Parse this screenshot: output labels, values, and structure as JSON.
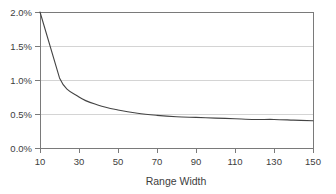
{
  "chart_data": {
    "type": "line",
    "title": "",
    "xlabel": "Range Width",
    "ylabel": "",
    "xlim": [
      10,
      150
    ],
    "ylim": [
      0.0,
      2.0
    ],
    "grid": true,
    "legend": false,
    "x_ticks": [
      10,
      30,
      50,
      70,
      90,
      110,
      130,
      150
    ],
    "x_tick_labels": [
      "10",
      "30",
      "50",
      "70",
      "90",
      "110",
      "130",
      "150"
    ],
    "y_ticks": [
      0.0,
      0.5,
      1.0,
      1.5,
      2.0
    ],
    "y_tick_labels": [
      "0.0%",
      "0.5%",
      "1.0%",
      "1.5%",
      "2.0%"
    ],
    "y_unit": "%",
    "series": [
      {
        "name": "",
        "color": "#444444",
        "x": [
          10,
          20,
          30,
          40,
          50,
          60,
          70,
          80,
          90,
          100,
          110,
          120,
          130,
          140,
          150
        ],
        "values": [
          2.0,
          1.03,
          0.75,
          0.63,
          0.56,
          0.51,
          0.48,
          0.46,
          0.45,
          0.44,
          0.43,
          0.42,
          0.42,
          0.41,
          0.4
        ]
      }
    ]
  },
  "axis_labels": {
    "y": {
      "t0": "0.0%",
      "t1": "0.5%",
      "t2": "1.0%",
      "t3": "1.5%",
      "t4": "2.0%"
    },
    "x": {
      "t0": "10",
      "t1": "30",
      "t2": "50",
      "t3": "70",
      "t4": "90",
      "t5": "110",
      "t6": "130",
      "t7": "150"
    },
    "x_title": "Range Width"
  },
  "colors": {
    "series": "#444444",
    "grid": "#c9c9c9",
    "frame": "#7a7a7a",
    "text": "#3d3d3d",
    "background": "#ffffff"
  }
}
